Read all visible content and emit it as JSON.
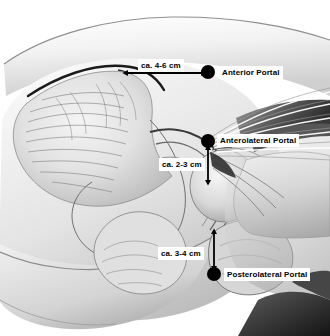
{
  "figure": {
    "kind": "anatomical-illustration",
    "background_color": "#ffffff",
    "ink_color": "#000000"
  },
  "markers": [
    {
      "id": "anterior",
      "label": "Anterior Portal",
      "dot_color": "#000000",
      "dot_x": 208,
      "dot_y": 72,
      "dot_r": 7,
      "label_x": 219,
      "label_y": 66
    },
    {
      "id": "anterolateral",
      "label": "Anterolateral Portal",
      "dot_color": "#000000",
      "dot_x": 208,
      "dot_y": 141,
      "dot_r": 7,
      "label_x": 217,
      "label_y": 134
    },
    {
      "id": "posterolateral",
      "label": "Posterolateral Portal",
      "dot_color": "#000000",
      "dot_x": 214,
      "dot_y": 274,
      "dot_r": 7,
      "label_x": 224,
      "label_y": 268
    }
  ],
  "measurements": [
    {
      "id": "anterior-distance",
      "text": "ca. 4-6 cm",
      "orientation": "horizontal",
      "label_x": 138,
      "label_y": 59,
      "arrow_x1": 128,
      "arrow_y1": 73,
      "arrow_x2": 201,
      "arrow_y2": 73
    },
    {
      "id": "anterolateral-distance",
      "text": "ca. 2-3 cm",
      "orientation": "vertical",
      "label_x": 159,
      "label_y": 158,
      "arrow_x1": 208,
      "arrow_y1": 150,
      "arrow_x2": 208,
      "arrow_y2": 180
    },
    {
      "id": "posterolateral-distance",
      "text": "ca. 3-4 cm",
      "orientation": "vertical",
      "label_x": 158,
      "label_y": 247,
      "arrow_x1": 214,
      "arrow_y1": 234,
      "arrow_x2": 214,
      "arrow_y2": 266
    }
  ]
}
